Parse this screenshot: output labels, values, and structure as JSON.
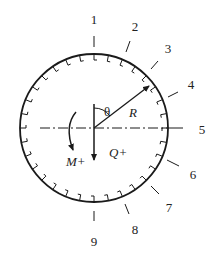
{
  "diagram": {
    "center": [
      94,
      128
    ],
    "radius": 74,
    "stroke_color": "#1a1a1a",
    "section_labels": [
      {
        "id": "1",
        "text": "1",
        "x": 94,
        "y": 24,
        "tick": [
          94,
          36,
          94,
          47
        ]
      },
      {
        "id": "2",
        "text": "2",
        "x": 135,
        "y": 31,
        "tick": [
          130,
          41,
          126,
          52
        ]
      },
      {
        "id": "3",
        "text": "3",
        "x": 168,
        "y": 53,
        "tick": [
          158,
          61,
          151,
          69
        ]
      },
      {
        "id": "4",
        "text": "4",
        "x": 191,
        "y": 89,
        "tick": [
          178,
          92,
          168,
          97
        ]
      },
      {
        "id": "5",
        "text": "5",
        "x": 202,
        "y": 134,
        "tick": [
          172,
          128,
          183,
          128
        ]
      },
      {
        "id": "6",
        "text": "6",
        "x": 193,
        "y": 179,
        "tick": [
          167,
          160,
          179,
          166
        ]
      },
      {
        "id": "7",
        "text": "7",
        "x": 169,
        "y": 212,
        "tick": [
          151,
          186,
          159,
          194
        ]
      },
      {
        "id": "8",
        "text": "8",
        "x": 135,
        "y": 234,
        "tick": [
          125,
          204,
          129,
          214
        ]
      },
      {
        "id": "9",
        "text": "9",
        "x": 94,
        "y": 246,
        "tick": [
          94,
          211,
          94,
          221
        ]
      }
    ],
    "symbols": {
      "theta": "θ",
      "radius": "R",
      "shear": "Q+",
      "moment": "M+"
    }
  }
}
